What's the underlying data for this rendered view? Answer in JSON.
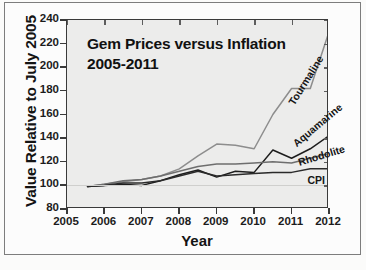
{
  "figure": {
    "border": true,
    "background": "#fbfbfa",
    "plot_background": "#ececeb"
  },
  "chart_data": {
    "type": "line",
    "title": "Gem Prices versus Inflation",
    "subtitle": "2005-2011",
    "xlabel": "Year",
    "ylabel": "Value Relative to July 2005",
    "xlim": [
      2005,
      2012
    ],
    "ylim": [
      80,
      240
    ],
    "xticks": [
      2005,
      2006,
      2007,
      2008,
      2009,
      2010,
      2011,
      2012
    ],
    "yticks": [
      80,
      100,
      120,
      140,
      160,
      180,
      200,
      220,
      240
    ],
    "grid": false,
    "reference_line": 100,
    "legend_position": "inline-right-labels",
    "series": [
      {
        "name": "Tourmaline",
        "color": "#8d8d8d",
        "label_rotation": -58,
        "x": [
          2005.55,
          2006.0,
          2006.5,
          2007.0,
          2007.5,
          2008.0,
          2008.5,
          2009.0,
          2009.5,
          2010.0,
          2010.5,
          2011.0,
          2011.5,
          2012.0
        ],
        "values": [
          99,
          101,
          103,
          105,
          108,
          114,
          125,
          135,
          134,
          131,
          160,
          182,
          182,
          230
        ]
      },
      {
        "name": "Aquamarine",
        "color": "#1d1d1d",
        "label_rotation": -40,
        "x": [
          2005.55,
          2006.0,
          2006.5,
          2007.0,
          2007.5,
          2008.0,
          2008.5,
          2009.0,
          2009.5,
          2010.0,
          2010.5,
          2011.0,
          2011.5,
          2012.0
        ],
        "values": [
          99,
          100,
          101,
          100,
          104,
          109,
          113,
          107,
          112,
          111,
          130,
          123,
          131,
          142
        ]
      },
      {
        "name": "Rhodolite",
        "color": "#6e6e6e",
        "label_rotation": -20,
        "x": [
          2005.55,
          2006.0,
          2006.5,
          2007.0,
          2007.5,
          2008.0,
          2008.5,
          2009.0,
          2009.5,
          2010.0,
          2010.5,
          2011.0,
          2011.5,
          2012.0
        ],
        "values": [
          99,
          101,
          104,
          105,
          108,
          112,
          116,
          118,
          118,
          119,
          120,
          119,
          123,
          127
        ]
      },
      {
        "name": "CPI",
        "color": "#2a2a2a",
        "label_rotation": 0,
        "x": [
          2005.55,
          2006.0,
          2006.5,
          2007.0,
          2007.5,
          2008.0,
          2008.5,
          2009.0,
          2009.5,
          2010.0,
          2010.5,
          2011.0,
          2011.5,
          2012.0
        ],
        "values": [
          99,
          100,
          102,
          102,
          104,
          108,
          112,
          108,
          109,
          110,
          111,
          111,
          114,
          114
        ]
      }
    ]
  }
}
